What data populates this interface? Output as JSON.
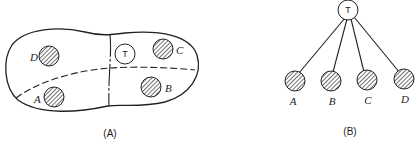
{
  "panel_a": {
    "caption": "(A)",
    "root_label": "T",
    "regions": [
      {
        "label": "D"
      },
      {
        "label": "C"
      },
      {
        "label": "A"
      },
      {
        "label": "B"
      }
    ]
  },
  "panel_b": {
    "caption": "(B)",
    "root_label": "T",
    "children": [
      {
        "label": "A"
      },
      {
        "label": "B"
      },
      {
        "label": "C"
      },
      {
        "label": "D"
      }
    ]
  },
  "colors": {
    "stroke": "#222222",
    "background": "#ffffff"
  }
}
